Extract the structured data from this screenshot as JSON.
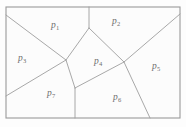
{
  "figure": {
    "type": "voronoi-partition-diagram",
    "title": "",
    "background_color": "#fdfdfd",
    "line_color": "#9e9e9e",
    "label_color": "#6e6e6e",
    "frame": {
      "x": 6,
      "y": 7,
      "width": 174,
      "height": 111
    }
  },
  "cells": [
    {
      "id": "p1",
      "symbol": "p",
      "subscript": "1",
      "label": "p1",
      "label_x": 51,
      "label_y": 21
    },
    {
      "id": "p2",
      "symbol": "p",
      "subscript": "2",
      "label": "p2",
      "label_x": 112,
      "label_y": 17
    },
    {
      "id": "p3",
      "symbol": "p",
      "subscript": "3",
      "label": "p3",
      "label_x": 18,
      "label_y": 54
    },
    {
      "id": "p4",
      "symbol": "p",
      "subscript": "4",
      "label": "p4",
      "label_x": 94,
      "label_y": 57
    },
    {
      "id": "p5",
      "symbol": "p",
      "subscript": "5",
      "label": "p5",
      "label_x": 152,
      "label_y": 62
    },
    {
      "id": "p6",
      "symbol": "p",
      "subscript": "6",
      "label": "p6",
      "label_x": 113,
      "label_y": 93
    },
    {
      "id": "p7",
      "symbol": "p",
      "subscript": "7",
      "label": "p7",
      "label_x": 47,
      "label_y": 89
    }
  ],
  "vertices": {
    "frame_top_left": [
      6,
      7
    ],
    "frame_top_right": [
      180,
      7
    ],
    "frame_bottom_right": [
      180,
      118
    ],
    "frame_bottom_left": [
      6,
      118
    ],
    "left_upper_junction": [
      6,
      15
    ],
    "left_lower_junction": [
      6,
      96
    ],
    "top_junction": [
      89,
      7
    ],
    "right_junction": [
      180,
      14
    ],
    "bottom_junction": [
      75,
      118
    ],
    "bottom_right_junction": [
      150,
      118
    ],
    "node_a": [
      66,
      60
    ],
    "node_b": [
      89,
      28
    ],
    "node_c": [
      124,
      62
    ],
    "node_d": [
      75,
      88
    ]
  },
  "edges": [
    {
      "name": "left-upper-to-node-a",
      "path": [
        [
          6,
          15
        ],
        [
          66,
          60
        ]
      ]
    },
    {
      "name": "left-lower-to-node-a",
      "path": [
        [
          6,
          96
        ],
        [
          66,
          60
        ]
      ]
    },
    {
      "name": "node-a-to-node-b",
      "path": [
        [
          66,
          60
        ],
        [
          89,
          28
        ]
      ]
    },
    {
      "name": "top-to-node-b",
      "path": [
        [
          89,
          7
        ],
        [
          89,
          28
        ]
      ]
    },
    {
      "name": "node-b-to-node-c",
      "path": [
        [
          89,
          28
        ],
        [
          124,
          62
        ]
      ]
    },
    {
      "name": "node-c-to-right",
      "path": [
        [
          124,
          62
        ],
        [
          180,
          14
        ]
      ]
    },
    {
      "name": "node-a-to-node-d",
      "path": [
        [
          66,
          60
        ],
        [
          75,
          88
        ]
      ]
    },
    {
      "name": "node-c-to-node-d",
      "path": [
        [
          124,
          62
        ],
        [
          75,
          88
        ]
      ]
    },
    {
      "name": "node-d-to-bottom",
      "path": [
        [
          75,
          88
        ],
        [
          75,
          118
        ]
      ]
    },
    {
      "name": "node-c-to-bottom-right",
      "path": [
        [
          124,
          62
        ],
        [
          150,
          118
        ]
      ]
    }
  ]
}
